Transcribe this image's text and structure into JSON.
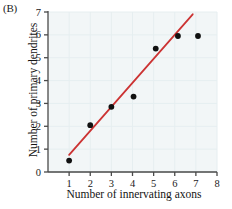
{
  "panel": {
    "label": "(B)"
  },
  "colors": {
    "plot_background": "#f2f6f7",
    "axis": "#4a4a4a",
    "point": "#111111",
    "trendline": "#cc3333",
    "tick_label": "#1a1a1a",
    "title": "#141414",
    "gridline": "#e6eef0"
  },
  "chart_data": {
    "type": "scatter",
    "title": "",
    "xlabel": "Number of innervating axons",
    "ylabel": "Number of primary dendrites",
    "xlim": [
      0,
      8
    ],
    "ylim": [
      0,
      7
    ],
    "xticks": [
      "1",
      "2",
      "3",
      "4",
      "5",
      "6",
      "7",
      "8"
    ],
    "xtick_values": [
      1,
      2,
      3,
      4,
      5,
      6,
      7,
      8
    ],
    "yticks": [
      "0",
      "1",
      "2",
      "3",
      "4",
      "5",
      "6",
      "7"
    ],
    "ytick_values": [
      0,
      1,
      2,
      3,
      4,
      5,
      6,
      7
    ],
    "grid": true,
    "legend": "none",
    "series": [
      {
        "name": "Observations",
        "marker": "filled-circle",
        "points": [
          {
            "x": 1.0,
            "y": 0.5
          },
          {
            "x": 2.0,
            "y": 2.05
          },
          {
            "x": 3.0,
            "y": 2.85
          },
          {
            "x": 4.05,
            "y": 3.3
          },
          {
            "x": 5.1,
            "y": 5.4
          },
          {
            "x": 6.15,
            "y": 5.95
          },
          {
            "x": 7.1,
            "y": 5.95
          }
        ]
      },
      {
        "name": "Regression line",
        "type": "line",
        "x_start": 1.0,
        "y_start": 0.75,
        "x_end": 6.85,
        "y_end": 6.9
      }
    ]
  }
}
